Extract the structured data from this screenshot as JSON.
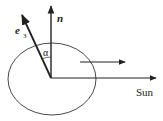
{
  "diagram": {
    "labels": {
      "normal": "n",
      "axis_e": "e",
      "axis_sub": "3",
      "angle": "α",
      "sun": "Sun"
    },
    "colors": {
      "stroke": "#222222",
      "background": "#ffffff"
    }
  }
}
